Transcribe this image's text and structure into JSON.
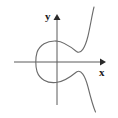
{
  "figure": {
    "title": "",
    "frame": {
      "present": true,
      "color": "#3a3a3a",
      "x": 4,
      "y": 3,
      "width": 110,
      "height": 112
    },
    "background_color": "#ffffff"
  },
  "axes": {
    "x_label": "x",
    "y_label": "y",
    "axis_color": "#5a5a5a",
    "origin": {
      "x": 57,
      "y": 62
    },
    "x_axis": {
      "x_start": 14,
      "x_end": 102,
      "y": 62,
      "arrow": "right"
    },
    "y_axis": {
      "x": 57,
      "y_start": 105,
      "y_end": 16,
      "arrow": "up"
    },
    "ticks": [],
    "tick_labels": []
  },
  "chart_data": {
    "type": "line",
    "title": "",
    "xlabel": "x",
    "ylabel": "y",
    "grid": false,
    "legend": null,
    "xlim": [
      -3.2,
      3.2
    ],
    "ylim": [
      -3.2,
      3.2
    ],
    "series": [
      {
        "name": "oval-component",
        "closed": true,
        "color": "#6b6b6b",
        "points_px": [
          [
            56,
            41
          ],
          [
            48,
            41
          ],
          [
            41,
            45
          ],
          [
            37,
            52
          ],
          [
            36,
            60
          ],
          [
            37,
            68
          ],
          [
            41,
            76
          ],
          [
            48,
            81
          ],
          [
            56,
            82
          ]
        ]
      },
      {
        "name": "unbounded-branch-upper",
        "closed": false,
        "color": "#6b6b6b",
        "points_px": [
          [
            56,
            41
          ],
          [
            63,
            42
          ],
          [
            70,
            47
          ],
          [
            76,
            52
          ],
          [
            82,
            50
          ],
          [
            87,
            40
          ],
          [
            91,
            24
          ],
          [
            94,
            8
          ]
        ]
      },
      {
        "name": "unbounded-branch-lower",
        "closed": false,
        "color": "#6b6b6b",
        "points_px": [
          [
            56,
            82
          ],
          [
            63,
            81
          ],
          [
            70,
            76
          ],
          [
            76,
            72
          ],
          [
            82,
            74
          ],
          [
            87,
            84
          ],
          [
            91,
            98
          ],
          [
            95,
            110
          ]
        ]
      }
    ]
  }
}
